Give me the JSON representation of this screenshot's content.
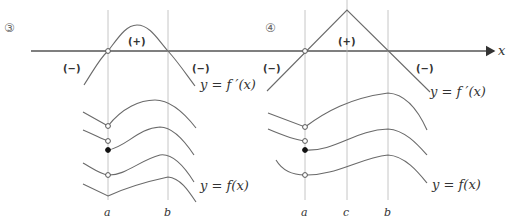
{
  "panels": [
    {
      "label": "③",
      "derivative_label": "y = f ′(x)",
      "function_label": "y = f(x)",
      "signs": {
        "left": "(−)",
        "middle": "(+)",
        "right": "(−)"
      },
      "ticks": [
        "a",
        "b"
      ]
    },
    {
      "label": "④",
      "derivative_label": "y = f ′(x)",
      "function_label": "y = f(x)",
      "signs": {
        "left": "(−)",
        "middle": "(+)",
        "right": "(−)"
      },
      "ticks": [
        "a",
        "c",
        "b"
      ]
    }
  ],
  "axis": {
    "label": "x"
  },
  "colors": {
    "axis": "#555555",
    "curve": "#6a6a6a",
    "guide": "#b8b8b8"
  }
}
